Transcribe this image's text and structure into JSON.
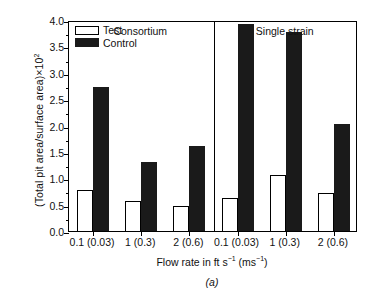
{
  "chart_data": {
    "type": "bar",
    "title": "",
    "subtitle": "",
    "caption": "(a)",
    "xlabel_parts": {
      "pre": "Flow rate in ft s",
      "sup1": "−1",
      "mid": " (ms",
      "sup2": "−1",
      "post": ")"
    },
    "xlabel": "Flow rate in ft s−1 (ms−1)",
    "ylabel_parts": {
      "text": "(Total pit area/surface area)×10",
      "sup": "2"
    },
    "ylabel": "(Total pit area/surface area)×10²",
    "ylim": [
      0.0,
      4.0
    ],
    "ytick_values": [
      0.0,
      0.5,
      1.0,
      1.5,
      2.0,
      2.5,
      3.0,
      3.5,
      4.0
    ],
    "ytick_labels": [
      "0.0",
      "0.5",
      "1.0",
      "1.5",
      "2.0",
      "2.5",
      "3.0",
      "3.5",
      "4.0"
    ],
    "yminor_step": 0.25,
    "grid": false,
    "legend_position": "top-left-inside",
    "legend": [
      {
        "name": "Test",
        "fill": "#ffffff",
        "stroke": "#000000"
      },
      {
        "name": "Control",
        "fill": "#1a1a1a",
        "stroke": "#1a1a1a"
      }
    ],
    "panels": [
      {
        "name": "Consortium",
        "categories": [
          "0.1 (0.03)",
          "1 (0.3)",
          "2 (0.6)"
        ],
        "series": [
          {
            "name": "Test",
            "values": [
              0.77,
              0.57,
              0.47
            ]
          },
          {
            "name": "Control",
            "values": [
              2.73,
              1.3,
              1.62
            ]
          }
        ]
      },
      {
        "name": "Single strain",
        "categories": [
          "0.1 (0.03)",
          "1 (0.3)",
          "2 (0.6)"
        ],
        "series": [
          {
            "name": "Test",
            "values": [
              0.62,
              1.07,
              0.73
            ]
          },
          {
            "name": "Control",
            "values": [
              3.92,
              3.77,
              2.03
            ]
          }
        ]
      }
    ],
    "colors": {
      "test_fill": "#ffffff",
      "control_fill": "#1a1a1a",
      "axis": "#000000",
      "background": "#ffffff"
    }
  }
}
